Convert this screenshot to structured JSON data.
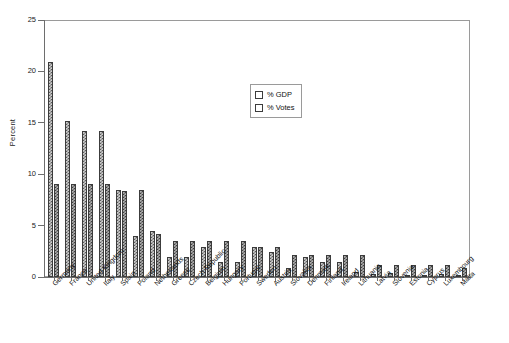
{
  "chart_data": {
    "type": "bar",
    "title": "",
    "xlabel": "",
    "ylabel": "Percent",
    "ylim": [
      0,
      25
    ],
    "yticks": [
      0,
      5,
      10,
      15,
      20,
      25
    ],
    "grid": false,
    "legend_position": "upper-center-right",
    "categories": [
      "Germany",
      "France",
      "United Kingdom",
      "Italy",
      "Spain",
      "Poland",
      "Netherlands",
      "Greece",
      "Czech Republic",
      "Belgium",
      "Hungary",
      "Portugal",
      "Sweden",
      "Austria",
      "Slovakia",
      "Denmark",
      "Finland",
      "Ireland",
      "Lithuania",
      "Latvia",
      "Slovenia",
      "Estonia",
      "Cyprus",
      "Luxembourg",
      "Malta"
    ],
    "series": [
      {
        "name": "% GDP",
        "values": [
          20.9,
          15.2,
          14.2,
          14.2,
          8.5,
          4.0,
          4.5,
          1.9,
          1.9,
          2.9,
          1.5,
          1.5,
          2.9,
          2.4,
          0.9,
          1.9,
          1.5,
          1.5,
          0.5,
          0.3,
          0.4,
          0.2,
          0.2,
          0.3,
          0.1
        ]
      },
      {
        "name": "% Votes",
        "values": [
          9.0,
          9.0,
          9.0,
          9.0,
          8.4,
          8.5,
          4.2,
          3.5,
          3.5,
          3.5,
          3.5,
          3.5,
          2.9,
          2.9,
          2.1,
          2.1,
          2.1,
          2.1,
          2.1,
          1.2,
          1.2,
          1.2,
          1.2,
          1.2,
          0.9
        ]
      }
    ]
  },
  "legend": {
    "items": [
      {
        "label": "% GDP"
      },
      {
        "label": "% Votes"
      }
    ]
  },
  "axes": {
    "y_title": "Percent",
    "y_tick_labels": [
      "0",
      "5",
      "10",
      "15",
      "20",
      "25"
    ]
  },
  "colors": {
    "gdp_fill": "#cfcfcf",
    "gdp_pattern": "#5a5a5a",
    "votes_fill": "#b0b0b0",
    "votes_pattern": "#3f3f3f",
    "axis": "#6e6e6e",
    "frame": "#9a9a9a",
    "background": "#ffffff"
  }
}
